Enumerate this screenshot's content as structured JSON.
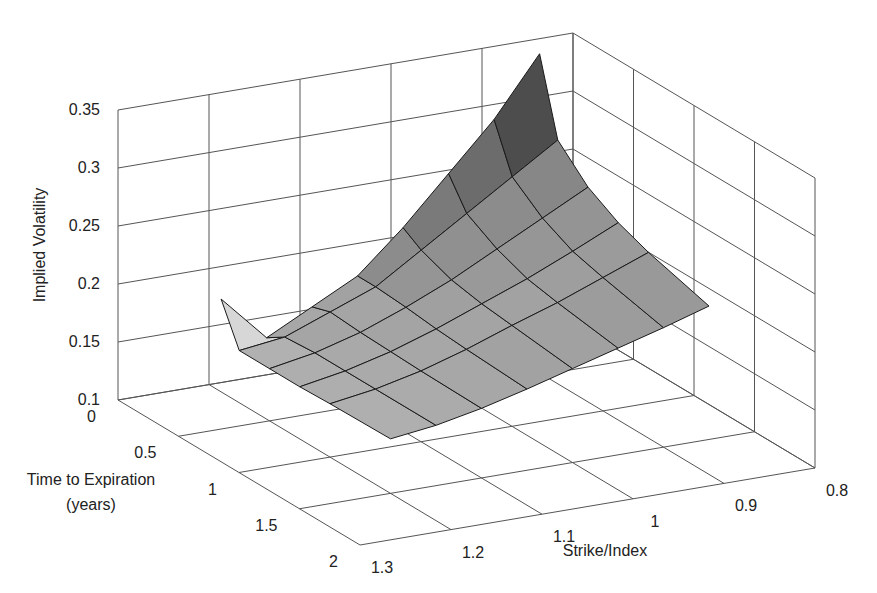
{
  "chart_data": {
    "type": "surface",
    "title": "",
    "zlabel": "Implied Volatility",
    "ylabel": "Time to Expiration (years)",
    "xlabel": "Strike/Index",
    "z_ticks": [
      "0.1",
      "0.15",
      "0.2",
      "0.25",
      "0.3",
      "0.35"
    ],
    "zlim": [
      0.1,
      0.35
    ],
    "t_ticks": [
      "0",
      "0.5",
      "1",
      "1.5",
      "2"
    ],
    "tlim": [
      0,
      2
    ],
    "k_ticks": [
      "1.3",
      "1.2",
      "1.1",
      "1",
      "0.9",
      "0.8"
    ],
    "klim": [
      0.8,
      1.3
    ],
    "grid": true,
    "colormap": "gray",
    "strikes": [
      0.85,
      0.9,
      0.95,
      1.0,
      1.05,
      1.1,
      1.15,
      1.2
    ],
    "expirations": [
      0.1,
      0.25,
      0.5,
      0.75,
      1.0,
      1.5
    ],
    "volatility": [
      [
        0.345,
        0.295,
        0.255,
        0.215,
        0.18,
        0.16,
        0.14,
        0.18
      ],
      [
        0.28,
        0.255,
        0.23,
        0.205,
        0.18,
        0.165,
        0.15,
        0.145
      ],
      [
        0.255,
        0.235,
        0.215,
        0.195,
        0.178,
        0.163,
        0.152,
        0.145
      ],
      [
        0.24,
        0.222,
        0.205,
        0.19,
        0.175,
        0.162,
        0.152,
        0.145
      ],
      [
        0.23,
        0.215,
        0.2,
        0.187,
        0.173,
        0.161,
        0.152,
        0.146
      ],
      [
        0.215,
        0.203,
        0.192,
        0.181,
        0.17,
        0.16,
        0.152,
        0.147
      ]
    ]
  },
  "axes": {
    "z_label": "Implied Volatility",
    "t_label_line1": "Time to Expiration",
    "t_label_line2": "(years)",
    "k_label": "Strike/Index"
  }
}
